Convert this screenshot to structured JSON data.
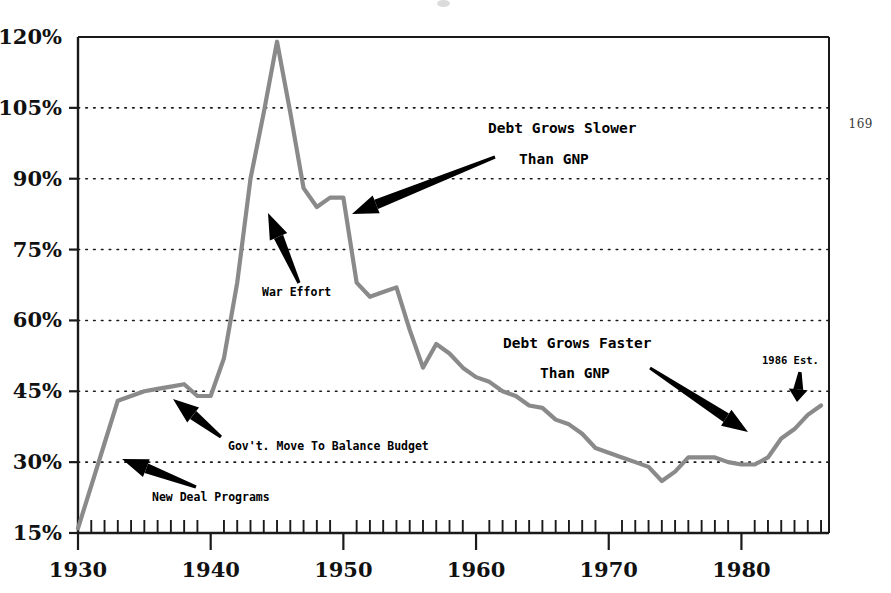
{
  "page": {
    "number": "169"
  },
  "chart_data": {
    "type": "line",
    "title": "",
    "subtitle": "",
    "xlabel": "",
    "ylabel": "",
    "xlim": [
      1930,
      1986.6
    ],
    "ylim": [
      15,
      120
    ],
    "grid": "horizontal-dotted",
    "legend": "none",
    "line_color": "#8a8a8a",
    "axis_color": "#1a1a1a",
    "y_ticks": [
      "15%",
      "30%",
      "45%",
      "60%",
      "75%",
      "90%",
      "105%",
      "120%"
    ],
    "y_tick_values": [
      15,
      30,
      45,
      60,
      75,
      90,
      105,
      120
    ],
    "x_ticks": [
      "1930",
      "1940",
      "1950",
      "1960",
      "1970",
      "1980"
    ],
    "x_tick_values": [
      1930,
      1940,
      1950,
      1960,
      1970,
      1980
    ],
    "x_minor_tick_step": 1,
    "series": [
      {
        "name": "Federal Debt as Percent of GNP",
        "x": [
          1930,
          1931,
          1932,
          1933,
          1934,
          1935,
          1936,
          1937,
          1938,
          1939,
          1940,
          1941,
          1942,
          1943,
          1944,
          1945,
          1946,
          1947,
          1948,
          1949,
          1950,
          1951,
          1952,
          1953,
          1954,
          1955,
          1956,
          1957,
          1958,
          1959,
          1960,
          1961,
          1962,
          1963,
          1964,
          1965,
          1966,
          1967,
          1968,
          1969,
          1970,
          1971,
          1972,
          1973,
          1974,
          1975,
          1976,
          1977,
          1978,
          1979,
          1980,
          1981,
          1982,
          1983,
          1984,
          1985,
          1986
        ],
        "values": [
          16,
          25,
          34,
          43,
          44,
          45,
          45.5,
          46,
          46.5,
          44,
          44,
          52,
          68,
          90,
          104,
          119,
          104,
          88,
          84,
          86,
          86,
          68,
          65,
          66,
          67,
          58,
          50,
          55,
          53,
          50,
          48,
          47,
          45,
          44,
          42,
          41.5,
          39,
          38,
          36,
          33,
          32,
          31,
          30,
          29,
          26,
          28,
          31,
          31,
          31,
          30,
          29.5,
          29.5,
          31,
          35,
          37,
          40,
          42
        ],
        "color": "#8a8a8a"
      }
    ],
    "annotations": [
      {
        "id": "new-deal",
        "label": "New Deal Programs",
        "text_x": 152,
        "text_y": 501,
        "arrow_from_x": 196,
        "arrow_from_y": 487,
        "arrow_to_x": 122,
        "arrow_to_y": 459
      },
      {
        "id": "balance-budget",
        "label": "Gov't. Move To Balance Budget",
        "text_x": 228,
        "text_y": 450,
        "arrow_from_x": 221,
        "arrow_from_y": 437,
        "arrow_to_x": 173,
        "arrow_to_y": 399
      },
      {
        "id": "war-effort",
        "label": "War Effort",
        "text_x": 262,
        "text_y": 296,
        "arrow_from_x": 299,
        "arrow_from_y": 283,
        "arrow_to_x": 268,
        "arrow_to_y": 213
      },
      {
        "id": "debt-slower",
        "label_line1": "Debt Grows Slower",
        "label_line2": "Than GNP",
        "text_x": 488,
        "text_y": 133,
        "text2_x": 519,
        "text2_y": 164,
        "arrow_from_x": 495,
        "arrow_from_y": 157,
        "arrow_to_x": 352,
        "arrow_to_y": 214
      },
      {
        "id": "debt-faster",
        "label_line1": "Debt Grows Faster",
        "label_line2": "Than GNP",
        "text_x": 503,
        "text_y": 348,
        "text2_x": 540,
        "text2_y": 378,
        "arrow_from_x": 650,
        "arrow_from_y": 368,
        "arrow_to_x": 748,
        "arrow_to_y": 432
      },
      {
        "id": "est-1986",
        "label": "1986 Est.",
        "text_x": 762,
        "text_y": 364,
        "arrow_from_x": 800,
        "arrow_from_y": 372,
        "arrow_to_x": 797,
        "arrow_to_y": 402
      }
    ]
  }
}
